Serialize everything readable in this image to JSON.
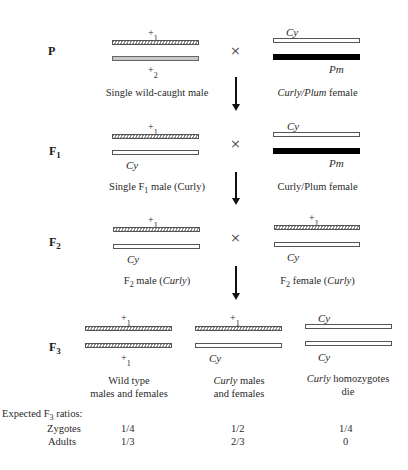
{
  "generations": {
    "P": {
      "label": "P",
      "sub": ""
    },
    "F1": {
      "label": "F",
      "sub": "1"
    },
    "F2": {
      "label": "F",
      "sub": "2"
    },
    "F3": {
      "label": "F",
      "sub": "3"
    }
  },
  "cross_symbol": "×",
  "p": {
    "male": {
      "top_allele": {
        "sym": "+",
        "sub": "1"
      },
      "bottom_allele": {
        "sym": "+",
        "sub": "2"
      },
      "caption": "Single wild-caught male"
    },
    "female": {
      "top_allele": "Cy",
      "bottom_allele": "Pm",
      "caption_italic": "Curly/Plum",
      "caption_rest": " female"
    }
  },
  "f1": {
    "male": {
      "top_allele": {
        "sym": "+",
        "sub": "1"
      },
      "bottom_allele": "Cy",
      "caption_pre": "Single F",
      "caption_sub": "1",
      "caption_post": " male (Curly)"
    },
    "female": {
      "top_allele": "Cy",
      "bottom_allele": "Pm",
      "caption": "Curly/Plum female"
    }
  },
  "f2": {
    "male": {
      "top_allele": {
        "sym": "+",
        "sub": "1"
      },
      "bottom_allele": "Cy",
      "caption_pre": "F",
      "caption_sub": "2",
      "caption_mid": " male (",
      "caption_italic": "Curly",
      "caption_post": ")"
    },
    "female": {
      "top_allele": {
        "sym": "+",
        "sub": "1"
      },
      "bottom_allele": "Cy",
      "caption_pre": "F",
      "caption_sub": "2",
      "caption_mid": " female (",
      "caption_italic": "Curly",
      "caption_post": ")"
    }
  },
  "f3": [
    {
      "top_allele": {
        "sym": "+",
        "sub": "1"
      },
      "bottom_allele": {
        "sym": "+",
        "sub": "1"
      },
      "caption_line1": "Wild type",
      "caption_line2": "males and females"
    },
    {
      "top_allele": {
        "sym": "+",
        "sub": "1"
      },
      "bottom_allele": "Cy",
      "caption_line1_italic": "Curly",
      "caption_line1_rest": " males",
      "caption_line2": "and females"
    },
    {
      "top_allele": "Cy",
      "bottom_allele": "Cy",
      "caption_line1_italic": "Curly",
      "caption_line1_rest": " homozygotes",
      "caption_line2": "die"
    }
  ],
  "ratios": {
    "heading_pre": "Expected F",
    "heading_sub": "3",
    "heading_post": " ratios:",
    "rows": [
      {
        "label": "Zygotes",
        "values": [
          "1/4",
          "1/2",
          "1/4"
        ]
      },
      {
        "label": "Adults",
        "values": [
          "1/3",
          "2/3",
          "0"
        ]
      }
    ]
  }
}
